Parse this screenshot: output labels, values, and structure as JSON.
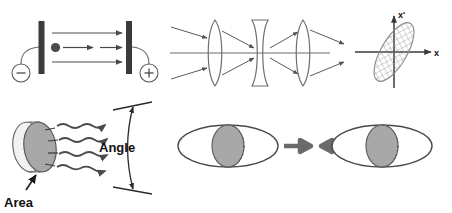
{
  "figure": {
    "title": "",
    "background_color": "#ffffff",
    "width": 452,
    "height": 213
  },
  "colors": {
    "stroke_dark": "#3a3a3a",
    "stroke_mid": "#555555",
    "stroke_light": "#888888",
    "plate_fill": "#3b3b3b",
    "disk_fill": "#a8a8a8",
    "disk_edge_fill": "#f2f2f2",
    "arrow_block": "#6a6a6a",
    "text": "#111111",
    "ellipse_hatch": "#9a9a9a"
  },
  "panels": {
    "accelerator": {
      "name": "charged-particle-acceleration-between-plates",
      "cathode_label": "−",
      "anode_label": "+",
      "particle_label": "",
      "field_arrow_count": 3,
      "plates": [
        {
          "side": "left",
          "polarity": "negative"
        },
        {
          "side": "right",
          "polarity": "positive"
        }
      ]
    },
    "lens_system": {
      "name": "three-element-lens-system",
      "elements": [
        {
          "type": "convex",
          "order": 1
        },
        {
          "type": "concave",
          "order": 2
        },
        {
          "type": "convex",
          "order": 3
        }
      ],
      "ray_arrow_count": 8,
      "optical_axis": true
    },
    "phase_space": {
      "name": "phase-space-emittance-ellipse",
      "x_axis_label": "x",
      "y_axis_label": "x'",
      "ellipse_tilt_degrees": -60,
      "ellipse_hatched": true
    },
    "emission": {
      "name": "area-and-angle-emission",
      "area_label": "Area",
      "angle_label": "Angle",
      "wavy_ray_count": 4,
      "tick_count": 4
    },
    "beam_compression": {
      "name": "beam-compression-ellipses",
      "left_figure": "ellipse-with-disk",
      "right_figure": "ellipse-with-disk",
      "arrows": [
        {
          "direction": "right"
        },
        {
          "direction": "left"
        }
      ]
    }
  }
}
